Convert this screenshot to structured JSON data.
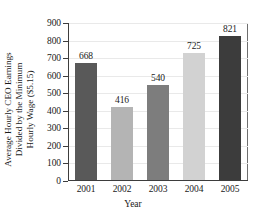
{
  "figure": {
    "cropped_title_fragment": "",
    "xaxis_title": "Year",
    "yaxis_title_line1": "Average Hourly CEO Earnings",
    "yaxis_title_line2": "Divided by the Minimum",
    "yaxis_title_line3": "Hourly Wage ($5.15)"
  },
  "chart_data": {
    "type": "bar",
    "title": "",
    "xlabel": "Year",
    "ylabel": "Average Hourly CEO Earnings Divided by the Minimum Hourly Wage ($5.15)",
    "categories": [
      "2001",
      "2002",
      "2003",
      "2004",
      "2005"
    ],
    "values": [
      668,
      416,
      540,
      725,
      821
    ],
    "bar_colors": [
      "#595959",
      "#b4b4b4",
      "#7d7d7d",
      "#d2d2d2",
      "#3c3c3c"
    ],
    "ylim": [
      0,
      900
    ],
    "ytick_values": [
      0,
      100,
      200,
      300,
      400,
      500,
      600,
      700,
      800,
      900
    ],
    "ytick_labels": [
      "0",
      "100",
      "200",
      "300",
      "400",
      "500",
      "600",
      "700",
      "800",
      "900"
    ],
    "data_labels": [
      "668",
      "416",
      "540",
      "725",
      "821"
    ],
    "grid": true,
    "grid_axis": "y",
    "legend": false,
    "legend_position": "none"
  }
}
